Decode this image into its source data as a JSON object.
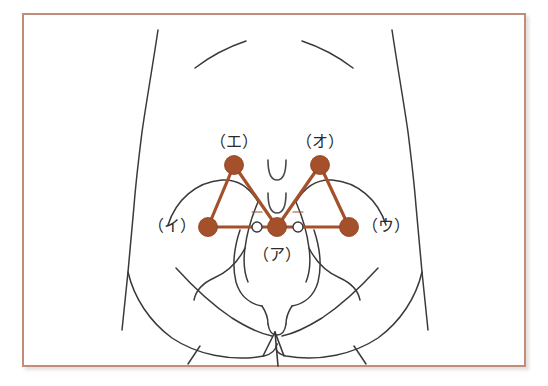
{
  "figure": {
    "frame_color": "#c08e78",
    "background_color": "#ffffff",
    "body_outline_color": "#3a3a3a",
    "marker_color": "#a4502a",
    "marker_line_color": "#a4502a",
    "open_marker_fill": "#ffffff",
    "open_marker_stroke": "#3a3a3a",
    "width": 548,
    "height": 386
  },
  "labels": {
    "a": "（ア）",
    "i": "（イ）",
    "u": "（ウ）",
    "e": "（エ）",
    "o": "（オ）"
  },
  "markers": [
    {
      "key": "a",
      "label": "（ア）",
      "x": 277,
      "y": 227,
      "r": 9,
      "type": "filled"
    },
    {
      "key": "i",
      "label": "（イ）",
      "x": 208,
      "y": 227,
      "r": 9,
      "type": "filled"
    },
    {
      "key": "u",
      "label": "（ウ）",
      "x": 349,
      "y": 227,
      "r": 9,
      "type": "filled"
    },
    {
      "key": "e",
      "label": "（エ）",
      "x": 234,
      "y": 165,
      "r": 9,
      "type": "filled"
    },
    {
      "key": "o",
      "label": "（オ）",
      "x": 320,
      "y": 165,
      "r": 9,
      "type": "filled"
    }
  ],
  "open_markers": [
    {
      "key": "left-open",
      "x": 257,
      "y": 227,
      "r": 5
    },
    {
      "key": "right-open",
      "x": 298,
      "y": 227,
      "r": 5
    }
  ],
  "label_positions": {
    "a": {
      "x": 277,
      "y": 254
    },
    "i": {
      "x": 172,
      "y": 227
    },
    "u": {
      "x": 386,
      "y": 227
    },
    "e": {
      "x": 234,
      "y": 143
    },
    "o": {
      "x": 320,
      "y": 143
    }
  },
  "connector_lines": [
    {
      "name": "i-to-e",
      "x1": 208,
      "y1": 227,
      "x2": 234,
      "y2": 165
    },
    {
      "name": "e-to-a",
      "x1": 234,
      "y1": 165,
      "x2": 277,
      "y2": 227
    },
    {
      "name": "i-to-a",
      "x1": 208,
      "y1": 227,
      "x2": 277,
      "y2": 227
    },
    {
      "name": "a-to-o",
      "x1": 277,
      "y1": 227,
      "x2": 320,
      "y2": 165
    },
    {
      "name": "o-to-u",
      "x1": 320,
      "y1": 165,
      "x2": 349,
      "y2": 227
    },
    {
      "name": "a-to-u",
      "x1": 277,
      "y1": 227,
      "x2": 349,
      "y2": 227
    }
  ]
}
